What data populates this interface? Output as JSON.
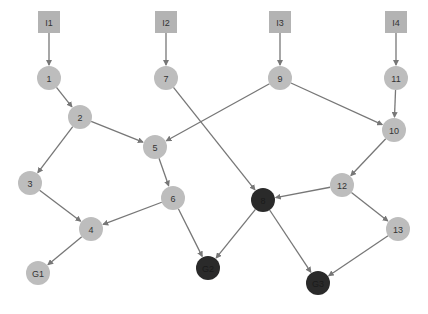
{
  "diagram": {
    "colors": {
      "input_fill": "#b3b3b3",
      "node_fill": "#bdbdbd",
      "goal_dark_fill": "#2a2a2a",
      "edge": "#777777",
      "label": "#333333",
      "dark_label": "#1a1a1a"
    },
    "nodes": [
      {
        "id": "I1",
        "label": "I1",
        "shape": "square",
        "x": 49,
        "y": 22,
        "dark": false
      },
      {
        "id": "I2",
        "label": "I2",
        "shape": "square",
        "x": 166,
        "y": 22,
        "dark": false
      },
      {
        "id": "I3",
        "label": "I3",
        "shape": "square",
        "x": 280,
        "y": 22,
        "dark": false
      },
      {
        "id": "I4",
        "label": "I4",
        "shape": "square",
        "x": 396,
        "y": 22,
        "dark": false
      },
      {
        "id": "1",
        "label": "1",
        "shape": "circle",
        "x": 49,
        "y": 78,
        "dark": false
      },
      {
        "id": "7",
        "label": "7",
        "shape": "circle",
        "x": 166,
        "y": 78,
        "dark": false
      },
      {
        "id": "9",
        "label": "9",
        "shape": "circle",
        "x": 280,
        "y": 78,
        "dark": false
      },
      {
        "id": "11",
        "label": "11",
        "shape": "circle",
        "x": 396,
        "y": 78,
        "dark": false
      },
      {
        "id": "2",
        "label": "2",
        "shape": "circle",
        "x": 80,
        "y": 117,
        "dark": false
      },
      {
        "id": "5",
        "label": "5",
        "shape": "circle",
        "x": 155,
        "y": 147,
        "dark": false
      },
      {
        "id": "10",
        "label": "10",
        "shape": "circle",
        "x": 394,
        "y": 130,
        "dark": false
      },
      {
        "id": "3",
        "label": "3",
        "shape": "circle",
        "x": 30,
        "y": 183,
        "dark": false
      },
      {
        "id": "6",
        "label": "6",
        "shape": "circle",
        "x": 173,
        "y": 198,
        "dark": false
      },
      {
        "id": "8",
        "label": "8",
        "shape": "circle",
        "x": 263,
        "y": 200,
        "dark": true
      },
      {
        "id": "12",
        "label": "12",
        "shape": "circle",
        "x": 342,
        "y": 185,
        "dark": false
      },
      {
        "id": "4",
        "label": "4",
        "shape": "circle",
        "x": 91,
        "y": 229,
        "dark": false
      },
      {
        "id": "13",
        "label": "13",
        "shape": "circle",
        "x": 398,
        "y": 229,
        "dark": false
      },
      {
        "id": "G1",
        "label": "G1",
        "shape": "circle",
        "x": 38,
        "y": 273,
        "dark": false
      },
      {
        "id": "G2",
        "label": "G2",
        "shape": "circle",
        "x": 208,
        "y": 268,
        "dark": true
      },
      {
        "id": "G3",
        "label": "G3",
        "shape": "circle",
        "x": 318,
        "y": 283,
        "dark": true
      }
    ],
    "edges": [
      [
        "I1",
        "1"
      ],
      [
        "I2",
        "7"
      ],
      [
        "I3",
        "9"
      ],
      [
        "I4",
        "11"
      ],
      [
        "1",
        "2"
      ],
      [
        "2",
        "5"
      ],
      [
        "2",
        "3"
      ],
      [
        "9",
        "5"
      ],
      [
        "9",
        "10"
      ],
      [
        "11",
        "10"
      ],
      [
        "5",
        "6"
      ],
      [
        "3",
        "4"
      ],
      [
        "6",
        "4"
      ],
      [
        "4",
        "G1"
      ],
      [
        "6",
        "G2"
      ],
      [
        "7",
        "8"
      ],
      [
        "10",
        "12"
      ],
      [
        "12",
        "8"
      ],
      [
        "12",
        "13"
      ],
      [
        "13",
        "G3"
      ],
      [
        "8",
        "G2"
      ],
      [
        "8",
        "G3"
      ]
    ]
  }
}
